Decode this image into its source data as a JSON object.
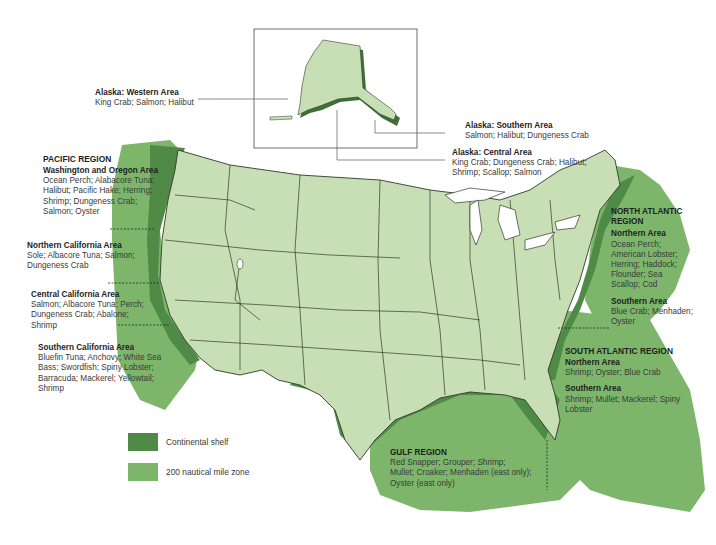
{
  "map": {
    "colors": {
      "land": "#c8dfb5",
      "continental_shelf": "#4f8a47",
      "nautical_zone": "#7db66a",
      "borders": "#2f3a2a",
      "background": "#ffffff"
    }
  },
  "legend": {
    "items": [
      {
        "label": "Continental shelf",
        "color": "#4f8a47"
      },
      {
        "label": "200 nautical mile zone",
        "color": "#7db66a"
      }
    ]
  },
  "alaska": {
    "western": {
      "title": "Alaska: Western Area",
      "species": "King Crab; Salmon; Halibut"
    },
    "southern": {
      "title": "Alaska: Southern Area",
      "species": "Salmon; Halibut; Dungeness Crab"
    },
    "central": {
      "title": "Alaska: Central Area",
      "species_line1": "King Crab; Dungeness Crab; Halibut;",
      "species_line2": "Shrimp; Scallop; Salmon"
    }
  },
  "pacific": {
    "region": "PACIFIC REGION",
    "washington_oregon": {
      "title": "Washington and Oregon Area",
      "lines": [
        "Ocean Perch; Alabacore Tuna;",
        "Halibut; Pacific Hake; Herring;",
        "Shrimp; Dungeness Crab;",
        "Salmon; Oyster"
      ]
    },
    "northern_california": {
      "title": "Northern California Area",
      "lines": [
        "Sole; Albacore Tuna; Salmon;",
        "Dungeness Crab"
      ]
    },
    "central_california": {
      "title": "Central California Area",
      "lines": [
        "Salmon; Albacore Tuna; Perch;",
        "Dungeness Crab; Abalone;",
        "Shrimp"
      ]
    },
    "southern_california": {
      "title": "Southern California Area",
      "lines": [
        "Bluefin Tuna; Anchovy; White Sea",
        "Bass; Swordfish; Spiny Lobster;",
        "Barracuda; Mackerel; Yellowtail;",
        "Shrimp"
      ]
    }
  },
  "north_atlantic": {
    "region_line1": "NORTH ATLANTIC",
    "region_line2": "REGION",
    "northern": {
      "title": "Northern Area",
      "lines": [
        "Ocean Perch;",
        "American Lobster;",
        "Herring; Haddock;",
        "Flounder; Sea",
        "Scallop; Cod"
      ]
    },
    "southern": {
      "title": "Southern Area",
      "lines": [
        "Blue Crab; Menhaden;",
        "Oyster"
      ]
    }
  },
  "south_atlantic": {
    "region": "SOUTH ATLANTIC REGION",
    "northern": {
      "title": "Northern Area",
      "lines": [
        "Shrimp; Oyster; Blue Crab"
      ]
    },
    "southern": {
      "title": "Southern Area",
      "lines": [
        "Shrimp; Mullet; Mackerel; Spiny",
        "Lobster"
      ]
    }
  },
  "gulf": {
    "region": "GULF REGION",
    "lines": [
      "Red Snapper; Grouper; Shrimp;",
      "Mullet; Croaker; Menhaden (east only);",
      "Oyster (east only)"
    ]
  }
}
